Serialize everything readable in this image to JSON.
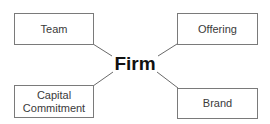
{
  "diagram": {
    "center": {
      "label": "Firm"
    },
    "nodes": [
      {
        "id": "team",
        "label": "Team",
        "position": "top-left"
      },
      {
        "id": "offering",
        "label": "Offering",
        "position": "top-right"
      },
      {
        "id": "capital-commitment",
        "label": "Capital\nCommitment",
        "position": "bottom-left"
      },
      {
        "id": "brand",
        "label": "Brand",
        "position": "bottom-right"
      }
    ],
    "edges": [
      {
        "from": "Firm",
        "to": "Team"
      },
      {
        "from": "Firm",
        "to": "Offering"
      },
      {
        "from": "Firm",
        "to": "Capital Commitment"
      },
      {
        "from": "Firm",
        "to": "Brand"
      }
    ],
    "colors": {
      "box_border": "#7a7a7a",
      "line": "#6a6a6a",
      "node_text": "#3a3a3a",
      "center_text": "#111111",
      "background": "#ffffff"
    }
  }
}
